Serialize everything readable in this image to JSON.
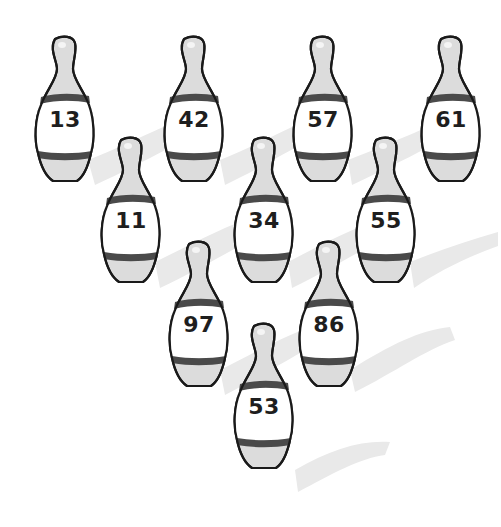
{
  "scene": {
    "subject": "bowling pins",
    "pin_count": 10,
    "colors": {
      "background": "#ffffff",
      "pin_body": "#dcdcdc",
      "pin_label_area": "#ffffff",
      "pin_band": "#4a4a4a",
      "outline": "#1a1a1a",
      "shadow": "#e8e8e8",
      "number_text": "#1e1e1e"
    }
  },
  "pins": [
    {
      "row": 1,
      "label": "13",
      "x": 33,
      "y": 35
    },
    {
      "row": 1,
      "label": "42",
      "x": 162,
      "y": 35
    },
    {
      "row": 1,
      "label": "57",
      "x": 291,
      "y": 35
    },
    {
      "row": 1,
      "label": "61",
      "x": 419,
      "y": 35
    },
    {
      "row": 2,
      "label": "11",
      "x": 99,
      "y": 136
    },
    {
      "row": 2,
      "label": "34",
      "x": 232,
      "y": 136
    },
    {
      "row": 2,
      "label": "55",
      "x": 354,
      "y": 136
    },
    {
      "row": 3,
      "label": "97",
      "x": 167,
      "y": 240
    },
    {
      "row": 3,
      "label": "86",
      "x": 297,
      "y": 240
    },
    {
      "row": 4,
      "label": "53",
      "x": 232,
      "y": 322
    }
  ]
}
